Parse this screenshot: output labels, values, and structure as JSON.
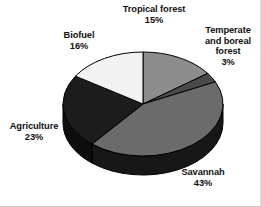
{
  "chart_data": {
    "type": "pie",
    "title": "",
    "subtitle": "",
    "xlabel": "",
    "ylabel": "",
    "legend_position": "none",
    "grid": false,
    "units": "percent",
    "total": 100,
    "categories": [
      "Tropical forest",
      "Temperate and boreal forest",
      "Savannah",
      "Agriculture",
      "Biofuel"
    ],
    "values": [
      15,
      3,
      43,
      23,
      16
    ],
    "labels": [
      "15%",
      "3%",
      "43%",
      "23%",
      "16%"
    ],
    "colors": [
      "#8d8d8d",
      "#4a4a4a",
      "#6b6b6b",
      "#1c1c1c",
      "#f2f2f2"
    ],
    "slices": [
      {
        "name": "Tropical forest",
        "value": 15,
        "label": "15%",
        "color": "#8d8d8d",
        "side_color": "#4f4f4f"
      },
      {
        "name": "Temperate and boreal forest",
        "value": 3,
        "label": "3%",
        "color": "#4a4a4a",
        "side_color": "#2a2a2a"
      },
      {
        "name": "Savannah",
        "value": 43,
        "label": "43%",
        "color": "#6b6b6b",
        "side_color": "#171717"
      },
      {
        "name": "Agriculture",
        "value": 23,
        "label": "23%",
        "color": "#1c1c1c",
        "side_color": "#0d0d0d"
      },
      {
        "name": "Biofuel",
        "value": 16,
        "label": "16%",
        "color": "#f2f2f2",
        "side_color": "#8a8a8a"
      }
    ]
  },
  "labels": {
    "tropical": {
      "name": "Tropical forest",
      "pct": "15%"
    },
    "temperate": {
      "line1": "Temperate",
      "line2": "and boreal",
      "line3": "forest",
      "pct": "3%"
    },
    "biofuel": {
      "name": "Biofuel",
      "pct": "16%"
    },
    "agriculture": {
      "name": "Agriculture",
      "pct": "23%"
    },
    "savannah": {
      "name": "Savannah",
      "pct": "43%"
    }
  },
  "figure": {
    "background": "#ffffff",
    "outline_color": "#000000"
  }
}
